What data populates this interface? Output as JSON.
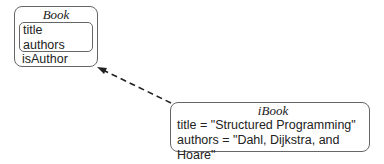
{
  "class_box": {
    "name": "Book",
    "attributes": [
      "title",
      "authors"
    ],
    "operations": [
      "isAuthor"
    ]
  },
  "instance_box": {
    "name": "iBook",
    "slots": [
      "title = \"Structured Programming\"",
      "authors = \"Dahl, Dijkstra, and Hoare\""
    ]
  },
  "relationship": {
    "type": "instance-of",
    "style": "dashed-arrow",
    "from": "iBook",
    "to": "Book"
  }
}
